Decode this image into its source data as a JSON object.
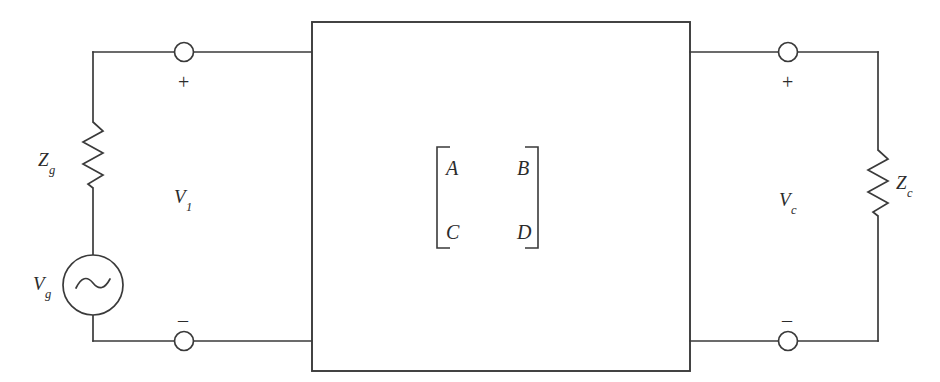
{
  "diagram": {
    "stroke_color": "#3a3a3a",
    "text_color": "#2b2b2b",
    "background": "#ffffff"
  },
  "source_side": {
    "source_label": "V",
    "source_sub": "g",
    "impedance_label": "Z",
    "impedance_sub": "g",
    "port_voltage_label": "V",
    "port_voltage_sub": "1",
    "plus_sign": "+",
    "minus_sign": "–",
    "source_icon": "ac-source-icon",
    "resistor_icon": "resistor-zigzag-icon",
    "terminal_icon": "terminal-node-icon"
  },
  "load_side": {
    "impedance_label": "Z",
    "impedance_sub": "c",
    "port_voltage_label": "V",
    "port_voltage_sub": "c",
    "plus_sign": "+",
    "minus_sign": "–",
    "resistor_icon": "resistor-zigzag-icon",
    "terminal_icon": "terminal-node-icon"
  },
  "two_port_box": {
    "name": "two-port-network-box",
    "matrix": {
      "rows": [
        [
          "A",
          "B"
        ],
        [
          "C",
          "D"
        ]
      ],
      "bracket_icon": "matrix-bracket-icon"
    }
  }
}
